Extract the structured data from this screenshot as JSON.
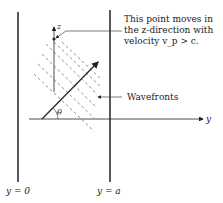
{
  "diagram": {
    "annotation": {
      "line1": "This point moves in",
      "line2": "the z-direction with",
      "line3": "velocity v_p > c."
    },
    "wavefronts_label": "Wavefronts",
    "axis_z": "z",
    "axis_y": "y",
    "angle_label": "θ",
    "wall_left_label": "y = 0",
    "wall_right_label": "y = a",
    "colors": {
      "ink": "#222222",
      "dash": "#555555"
    }
  }
}
